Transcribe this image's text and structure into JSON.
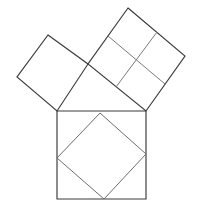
{
  "figure": {
    "title": "Pythagorean theorem squares figure",
    "canvas": {
      "width": 201,
      "height": 217
    },
    "colors": {
      "background": "#ffffff",
      "stroke_dark": "#3a3a3a",
      "stroke_light": "#6d6d6d",
      "divider": "#7a7a7a"
    },
    "shapes": [
      {
        "id": "hypotenuse-square",
        "label": "Bottom square",
        "kind": "square",
        "points": "57,111 146,111 146,199 57,199",
        "side_length": 89,
        "tone": "dark"
      },
      {
        "id": "inscribed-tilted-square",
        "label": "Inner tilted square",
        "kind": "square",
        "points": "100,113 146,154 104,199 57,158",
        "side_length": 62,
        "tone": "light"
      },
      {
        "id": "large-leg-square",
        "label": "Upper right square",
        "kind": "square",
        "points": "128,8 185,56 146,111 88,64",
        "side_length": 74,
        "tone": "dark"
      },
      {
        "id": "small-leg-square",
        "label": "Upper left square",
        "kind": "square",
        "points": "48,35 88,64 57,111 17,77",
        "side_length": 50,
        "tone": "dark"
      }
    ],
    "dividers": [
      {
        "id": "cross-line-vertical",
        "label": "Vertical midline of upper right square",
        "x1": 157,
        "y1": 32,
        "x2": 116,
        "y2": 87
      },
      {
        "id": "cross-line-horizontal",
        "label": "Horizontal midline of upper right square",
        "x1": 108,
        "y1": 36,
        "x2": 165,
        "y2": 84
      }
    ]
  }
}
